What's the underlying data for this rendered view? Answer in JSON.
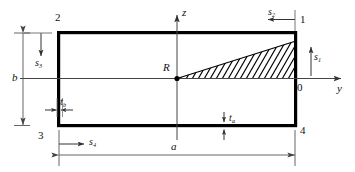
{
  "figure": {
    "type": "engineering-cross-section-diagram",
    "colors": {
      "outline": "#000000",
      "thin_line": "#555555",
      "hatch": "#000000",
      "background": "#ffffff"
    },
    "nodes": [
      {
        "id": "node-1",
        "label": "1",
        "position": "top-right"
      },
      {
        "id": "node-2",
        "label": "2",
        "position": "top-left"
      },
      {
        "id": "node-3",
        "label": "3",
        "position": "bottom-left"
      },
      {
        "id": "node-4",
        "label": "4",
        "position": "bottom-right"
      }
    ],
    "reference_point": {
      "label": "R",
      "description": "shear-centre / reference point at mid-height on vertical axis"
    },
    "origin_label": "0",
    "axes": [
      {
        "name": "z-axis",
        "label": "z",
        "direction": "up"
      },
      {
        "name": "y-axis",
        "label": "y",
        "direction": "right"
      }
    ],
    "arc_coordinates": [
      {
        "name": "s1",
        "base": "s",
        "sub": "1",
        "direction": "up",
        "location": "right wall"
      },
      {
        "name": "s2",
        "base": "s",
        "sub": "2",
        "direction": "left",
        "location": "top wall"
      },
      {
        "name": "s3",
        "base": "s",
        "sub": "3",
        "direction": "down",
        "location": "left wall"
      },
      {
        "name": "s4",
        "base": "s",
        "sub": "4",
        "direction": "right",
        "location": "bottom wall"
      }
    ],
    "thicknesses": [
      {
        "name": "ta",
        "base": "t",
        "sub": "a",
        "location": "horizontal walls"
      },
      {
        "name": "tb",
        "base": "t",
        "sub": "b",
        "location": "vertical walls"
      }
    ],
    "dimensions": [
      {
        "name": "a",
        "label": "a",
        "orientation": "horizontal",
        "location": "overall width"
      },
      {
        "name": "b",
        "label": "b",
        "orientation": "vertical",
        "location": "overall height"
      }
    ],
    "hatched_region": {
      "name": "swept-area-triangle",
      "description": "triangular hatched sectorial area swept from R to the right wall"
    }
  }
}
